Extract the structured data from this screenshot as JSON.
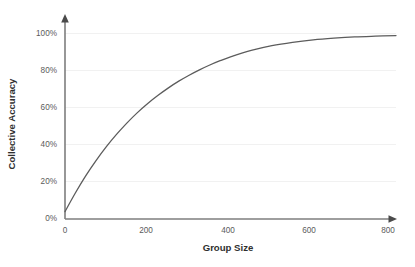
{
  "chart_data": {
    "type": "line",
    "title": "",
    "xlabel": "Group Size",
    "ylabel": "Collective Accuracy",
    "xlim": [
      0,
      800
    ],
    "ylim": [
      0,
      100
    ],
    "grid": true,
    "legend": null,
    "x_ticks": [
      "0",
      "200",
      "400",
      "600",
      "800"
    ],
    "x_tick_values": [
      0,
      200,
      400,
      600,
      800
    ],
    "y_ticks": [
      "0%",
      "20%",
      "40%",
      "60%",
      "80%",
      "100%"
    ],
    "y_tick_values": [
      0,
      20,
      40,
      60,
      80,
      100
    ],
    "series": [
      {
        "name": "Collective Accuracy",
        "color": "#5c5c5c",
        "x": [
          0,
          25,
          50,
          75,
          100,
          125,
          150,
          175,
          200,
          225,
          250,
          275,
          300,
          325,
          350,
          375,
          400,
          450,
          500,
          550,
          600,
          650,
          700,
          750,
          800
        ],
        "values": [
          4.0,
          14.0,
          23.2,
          31.4,
          38.9,
          45.6,
          51.7,
          57.2,
          62.1,
          66.5,
          70.5,
          74.1,
          77.3,
          80.2,
          82.8,
          85.1,
          87.2,
          90.6,
          93.2,
          95.0,
          96.3,
          97.2,
          97.9,
          98.3,
          98.6
        ]
      }
    ],
    "annotations": []
  },
  "axes": {
    "y_title": "Collective Accuracy",
    "x_title": "Group Size",
    "y_tick_0": "0%",
    "y_tick_1": "20%",
    "y_tick_2": "40%",
    "y_tick_3": "60%",
    "y_tick_4": "80%",
    "y_tick_5": "100%",
    "x_tick_0": "0",
    "x_tick_1": "200",
    "x_tick_2": "400",
    "x_tick_3": "600",
    "x_tick_4": "800"
  },
  "colors": {
    "line": "#5c5c5c",
    "axis": "#7e7e7e",
    "grid": "#f1f1f1",
    "background": "#ffffff",
    "text": "#4c4c4c"
  }
}
